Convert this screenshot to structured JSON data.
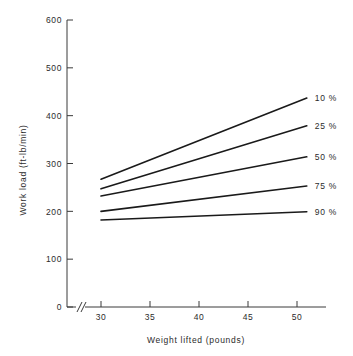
{
  "chart_data": {
    "type": "line",
    "title": "",
    "subtitle": "",
    "xlabel": "Weight lifted (pounds)",
    "ylabel": "Work load (ft-lb/min)",
    "xlim": [
      30,
      50
    ],
    "ylim": [
      0,
      600
    ],
    "x_ticks": [
      30,
      35,
      40,
      45,
      50
    ],
    "y_ticks": [
      0,
      100,
      200,
      300,
      400,
      500,
      600
    ],
    "x_tick_labels": [
      "30",
      "35",
      "40",
      "45",
      "50"
    ],
    "y_tick_labels": [
      "0",
      "100",
      "200",
      "300",
      "400",
      "500",
      "600"
    ],
    "x": [
      30,
      51
    ],
    "grid": false,
    "legend_position": "right-inline",
    "axis_break": true,
    "line_color": "#1a1a1a",
    "series": [
      {
        "name": "10 %",
        "label": "10 %",
        "values": [
          267,
          437
        ]
      },
      {
        "name": "25 %",
        "label": "25 %",
        "values": [
          247,
          379
        ]
      },
      {
        "name": "50 %",
        "label": "50 %",
        "values": [
          232,
          314
        ]
      },
      {
        "name": "75 %",
        "label": "75 %",
        "values": [
          200,
          253
        ]
      },
      {
        "name": "90 %",
        "label": "90 %",
        "values": [
          182,
          199
        ]
      }
    ]
  }
}
